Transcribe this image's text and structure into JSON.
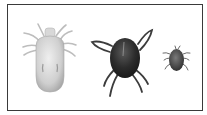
{
  "figure": {
    "border_color": "#3a3a3a",
    "subjects": [
      {
        "name": "pale-mite",
        "body_color": "#d2d2d2",
        "leg_color": "#bdbdbd"
      },
      {
        "name": "dark-mite",
        "body_color": "#2e2e2e",
        "leg_color": "#3c3c3c"
      },
      {
        "name": "small-mite",
        "body_color": "#4a4a4a",
        "leg_color": "#6a6a6a"
      }
    ]
  }
}
